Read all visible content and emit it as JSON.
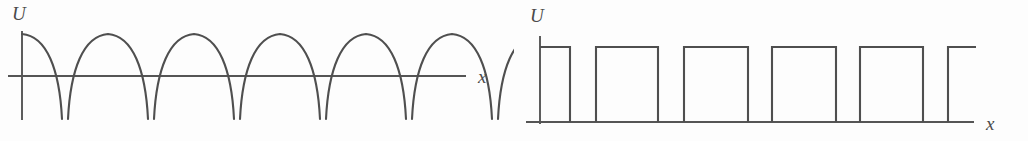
{
  "figure": {
    "background_color": "#fdfdfd",
    "line_color": "#4f4f4f",
    "axis_color": "#555555",
    "panel_count": 2
  },
  "panels": [
    {
      "id": "left",
      "name": "full-wave-rectified-waveform",
      "y_axis_label": "U",
      "x_axis_label": "x",
      "waveform_type": "full-wave-rectified-sine-arches",
      "description": "Series of rounded arches rising from below the axis, peaking above it, then falling back below",
      "arch_count_full": 5,
      "arch_partial_leading": 1,
      "arch_partial_trailing": 1,
      "geometry": {
        "y_axis_x": 22,
        "y_axis_top": 31,
        "y_axis_bottom": 120,
        "x_axis_y": 76,
        "x_axis_left": 8,
        "x_axis_right": 466,
        "arch_peak_y": 34,
        "arch_valley_y": 119,
        "arch_period": 86,
        "first_peak_x": 22,
        "gap_between_arches": 6
      },
      "labels": {
        "y": {
          "text": "U",
          "x": 12,
          "y": 20
        },
        "x": {
          "text": "x",
          "x": 478,
          "y": 83
        }
      }
    },
    {
      "id": "right",
      "name": "square-pulse-train-waveform",
      "y_axis_label": "U",
      "x_axis_label": "x",
      "waveform_type": "square-wave-pulse-train",
      "description": "Rectangular pulse train resting on the baseline, pulses alternate high and low",
      "pulse_count_full": 5,
      "pulse_partial_trailing": 1,
      "geometry": {
        "y_axis_x": 26,
        "y_axis_top": 36,
        "y_axis_bottom": 124,
        "baseline_y": 122,
        "baseline_left": 12,
        "baseline_right": 460,
        "pulse_top_y": 47,
        "period": 88,
        "duty_ratio": 0.72
      },
      "pulses": [
        {
          "start": 26,
          "end": 56,
          "partial": true
        },
        {
          "start": 82,
          "end": 144,
          "partial": false
        },
        {
          "start": 170,
          "end": 234,
          "partial": false
        },
        {
          "start": 258,
          "end": 322,
          "partial": false
        },
        {
          "start": 346,
          "end": 409,
          "partial": false
        },
        {
          "start": 434,
          "end": 462,
          "partial": true
        }
      ],
      "labels": {
        "y": {
          "text": "U",
          "x": 16,
          "y": 22
        },
        "x": {
          "text": "x",
          "x": 472,
          "y": 130
        }
      }
    }
  ],
  "chart_data": {
    "type": "line",
    "charts": [
      {
        "name": "full-wave-rectified-sine",
        "type": "line",
        "xlabel": "x",
        "ylabel": "U",
        "grid": false,
        "legend": null,
        "description": "Full-wave rectified sinusoid drawn as repeating arches; each arch rises from below the x-axis to a peak above it and returns below",
        "periods_shown": 6,
        "peak_value": 1.0,
        "trough_value": -0.5,
        "baseline_value": 0.0,
        "x": [
          0.0,
          0.25,
          0.5,
          0.75,
          1.0,
          1.25,
          1.5,
          1.75,
          2.0,
          2.25,
          2.5,
          2.75,
          3.0,
          3.25,
          3.5,
          3.75,
          4.0,
          4.25,
          4.5,
          4.75,
          5.0,
          5.25,
          5.5
        ],
        "values": [
          1.0,
          0.7,
          0.0,
          -0.5,
          -0.5,
          0.0,
          0.7,
          1.0,
          0.7,
          0.0,
          -0.5,
          -0.5,
          0.0,
          0.7,
          1.0,
          0.7,
          0.0,
          -0.5,
          -0.5,
          0.0,
          0.7,
          1.0,
          0.7
        ]
      },
      {
        "name": "square-pulse-train",
        "type": "line",
        "xlabel": "x",
        "ylabel": "U",
        "grid": false,
        "legend": null,
        "description": "Rectangular pulse train alternating between a high level and zero baseline",
        "periods_shown": 6,
        "high_value": 1.0,
        "low_value": 0.0,
        "duty_cycle": 0.72,
        "x": [
          0.0,
          0.34,
          0.34,
          0.64,
          0.64,
          1.34,
          1.34,
          1.64,
          1.64,
          2.34,
          2.34,
          2.64,
          2.64,
          3.34,
          3.34,
          3.64,
          3.64,
          4.34,
          4.34,
          4.64,
          4.64,
          5.2
        ],
        "values": [
          1.0,
          1.0,
          0.0,
          0.0,
          1.0,
          1.0,
          0.0,
          0.0,
          1.0,
          1.0,
          0.0,
          0.0,
          1.0,
          1.0,
          0.0,
          0.0,
          1.0,
          1.0,
          0.0,
          0.0,
          1.0,
          1.0
        ]
      }
    ]
  }
}
